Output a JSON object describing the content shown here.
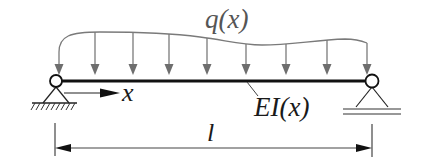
{
  "diagram": {
    "labels": {
      "load": "q(x)",
      "axis": "x",
      "stiffness": "EI(x)",
      "length": "l"
    },
    "elements": {
      "beam": "beam",
      "left_support": "pin-support",
      "right_support": "roller-support",
      "load_arrow_count": 9
    },
    "colors": {
      "beam": "#111111",
      "load": "#7a7a7a",
      "lines": "#333333"
    }
  }
}
